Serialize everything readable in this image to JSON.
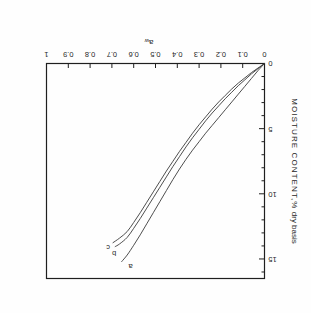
{
  "figure": {
    "rotation_degrees": 180,
    "background_color": "#fefefe",
    "line_color": "#3a3a3a",
    "frame_color": "#1f1f1f"
  },
  "chart_data": {
    "type": "line",
    "title": "",
    "xlabel": "a_w",
    "xlabel_base": "a",
    "xlabel_sub": "w",
    "ylabel": "MOISTURE CONTENT,% dry basis",
    "ylabel_caps": "MOISTURE CONTENT,%",
    "ylabel_lower": " dry basis",
    "xlim": [
      0,
      1
    ],
    "ylim": [
      0,
      16.5
    ],
    "grid": false,
    "legend_position": "inline-curve-end-labels",
    "x_major_ticks": [
      0,
      0.1,
      0.2,
      0.3,
      0.4,
      0.5,
      0.6,
      0.7,
      0.8,
      0.9,
      1
    ],
    "x_tick_labels": [
      "0",
      "0.1",
      "0.2",
      "0.3",
      "0.4",
      "0.5",
      "0.6",
      "0.7",
      "0.8",
      "0.9",
      "1"
    ],
    "y_major_ticks": [
      0,
      5,
      10,
      15
    ],
    "y_tick_labels": [
      "0",
      "5",
      "10",
      "15"
    ],
    "y_minor_tick_step": 1,
    "series": [
      {
        "name": "a",
        "label": "a",
        "x": [
          0.0,
          0.03,
          0.06,
          0.09,
          0.12,
          0.15,
          0.18,
          0.21,
          0.24,
          0.27,
          0.3,
          0.33,
          0.36,
          0.39,
          0.42,
          0.45,
          0.48,
          0.51,
          0.54,
          0.57,
          0.6,
          0.63,
          0.655
        ],
        "y": [
          0.0,
          0.55,
          1.15,
          1.75,
          2.35,
          2.95,
          3.55,
          4.15,
          4.75,
          5.35,
          6.0,
          6.65,
          7.35,
          8.1,
          8.9,
          9.75,
          10.6,
          11.45,
          12.3,
          13.15,
          13.95,
          14.7,
          15.2
        ]
      },
      {
        "name": "b",
        "label": "b",
        "x": [
          0.0,
          0.03,
          0.06,
          0.09,
          0.12,
          0.15,
          0.18,
          0.21,
          0.24,
          0.27,
          0.3,
          0.33,
          0.36,
          0.39,
          0.42,
          0.45,
          0.48,
          0.51,
          0.54,
          0.57,
          0.6,
          0.63,
          0.665,
          0.685
        ],
        "y": [
          0.0,
          0.4,
          0.8,
          1.25,
          1.7,
          2.2,
          2.7,
          3.25,
          3.8,
          4.4,
          5.05,
          5.7,
          6.4,
          7.15,
          7.9,
          8.7,
          9.5,
          10.3,
          11.1,
          11.9,
          12.65,
          13.35,
          13.85,
          14.05
        ]
      },
      {
        "name": "c",
        "label": "c",
        "x": [
          0.0,
          0.03,
          0.06,
          0.09,
          0.12,
          0.15,
          0.18,
          0.21,
          0.24,
          0.27,
          0.3,
          0.33,
          0.36,
          0.39,
          0.42,
          0.45,
          0.48,
          0.51,
          0.54,
          0.57,
          0.6,
          0.63,
          0.665,
          0.695
        ],
        "y": [
          0.0,
          0.35,
          0.7,
          1.1,
          1.5,
          1.95,
          2.45,
          2.95,
          3.5,
          4.1,
          4.7,
          5.35,
          6.05,
          6.75,
          7.5,
          8.25,
          9.05,
          9.85,
          10.65,
          11.45,
          12.2,
          12.9,
          13.4,
          13.75
        ]
      }
    ]
  }
}
